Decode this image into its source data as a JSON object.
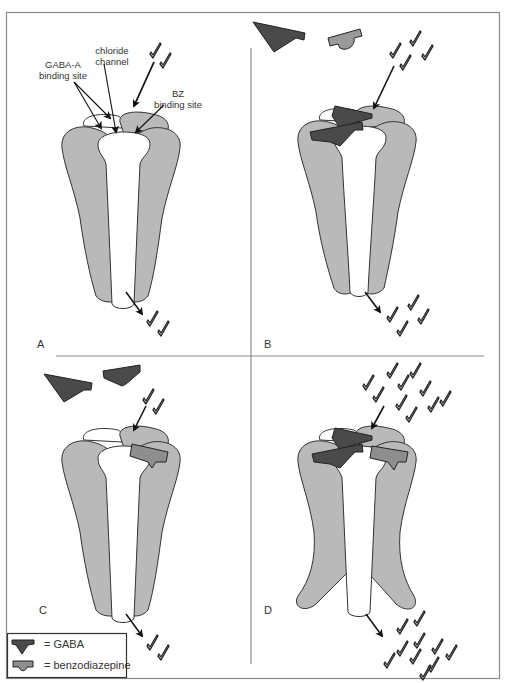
{
  "figure": {
    "colors": {
      "frame": "#8a8a8a",
      "subunit_gray": "#b9b9b9",
      "subunit_white": "#ffffff",
      "outline": "#333333",
      "gaba": "#4a4a4a",
      "benzodiazepine": "#8e8e8e",
      "arrow": "#111111"
    }
  },
  "annotations": {
    "gaba_site_line1": "GABA-A",
    "gaba_site_line2": "binding site",
    "chloride_line1": "chloride",
    "chloride_line2": "channel",
    "bz_line1": "BZ",
    "bz_line2": "binding site"
  },
  "panels": [
    {
      "letter": "A",
      "state": "resting",
      "ions_in": 2,
      "ions_out": 2
    },
    {
      "letter": "B",
      "state": "GABA bound",
      "ions_in": 4,
      "ions_out": 4
    },
    {
      "letter": "C",
      "state": "benzodiazepine bound",
      "ions_in": 2,
      "ions_out": 2
    },
    {
      "letter": "D",
      "state": "GABA and benzodiazepine bound",
      "ions_in": 10,
      "ions_out": 10
    }
  ],
  "legend": {
    "gaba_label": "= GABA",
    "bz_label": "= benzodiazepine"
  }
}
